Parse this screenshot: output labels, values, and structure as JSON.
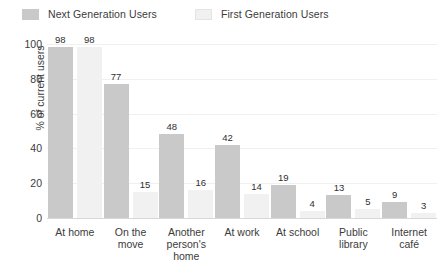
{
  "legend": {
    "position": "top-left",
    "items": [
      {
        "label": "Next Generation Users",
        "color": "#c9c9c9",
        "name": "next-generation-users"
      },
      {
        "label": "First Generation Users",
        "color": "#f1f1f1",
        "name": "first-generation-users"
      }
    ]
  },
  "axes": {
    "ylabel": "% of current users",
    "xlabel": "",
    "yticks": [
      "100",
      "80",
      "60",
      "40",
      "20",
      "0"
    ]
  },
  "chart_data": {
    "type": "bar",
    "title": "",
    "subtitle": "",
    "xlabel": "",
    "ylabel": "% of current users",
    "ylim": [
      0,
      100
    ],
    "ytick_values": [
      0,
      20,
      40,
      60,
      80,
      100
    ],
    "grid": true,
    "legend_position": "top-left",
    "categories": [
      "At home",
      "On the move",
      "Another person's home",
      "At work",
      "At school",
      "Public library",
      "Internet café"
    ],
    "category_label_lines": [
      [
        "At home"
      ],
      [
        "On the",
        "move"
      ],
      [
        "Another",
        "person's",
        "home"
      ],
      [
        "At work"
      ],
      [
        "At school"
      ],
      [
        "Public",
        "library"
      ],
      [
        "Internet",
        "café"
      ]
    ],
    "series": [
      {
        "name": "Next Generation Users",
        "color": "#c9c9c9",
        "values": [
          98,
          77,
          48,
          42,
          19,
          13,
          9
        ]
      },
      {
        "name": "First Generation Users",
        "color": "#f1f1f1",
        "values": [
          98,
          15,
          16,
          14,
          4,
          5,
          3
        ]
      }
    ]
  }
}
